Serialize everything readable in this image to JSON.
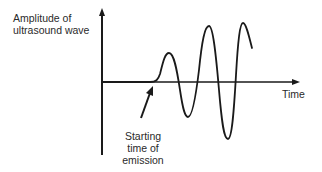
{
  "diagram": {
    "title": "",
    "y_axis_label_line1": "Amplitude of",
    "y_axis_label_line2": "ultrasound wave",
    "x_axis_label": "Time",
    "annotation_line1": "Starting",
    "annotation_line2": "time of",
    "annotation_line3": "emission",
    "stroke_color": "#1a1a1a"
  }
}
